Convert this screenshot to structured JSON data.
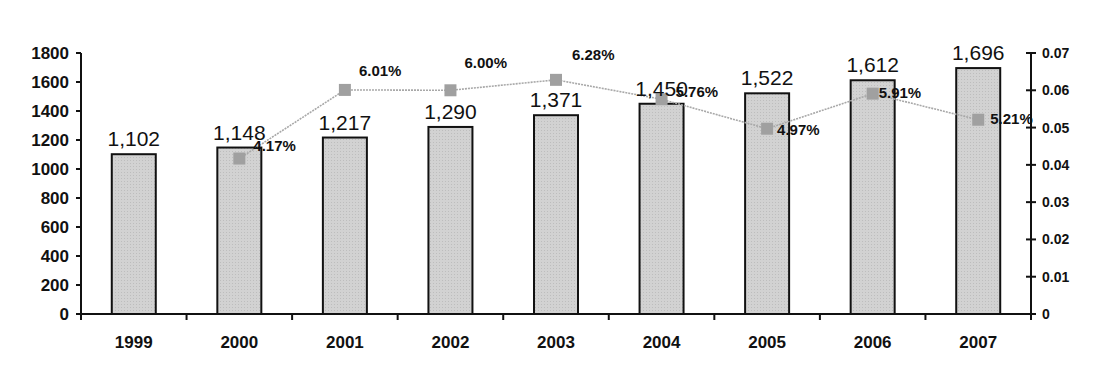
{
  "chart_data": {
    "type": "bar+line",
    "title": "",
    "xlabel": "",
    "ylabel": "",
    "y2label": "",
    "categories": [
      "1999",
      "2000",
      "2001",
      "2002",
      "2003",
      "2004",
      "2005",
      "2006",
      "2007"
    ],
    "series": [
      {
        "name": "Value",
        "type": "bar",
        "axis": "left",
        "values": [
          1102,
          1148,
          1217,
          1290,
          1371,
          1450,
          1522,
          1612,
          1696
        ],
        "labels": [
          "1,102",
          "1,148",
          "1,217",
          "1,290",
          "1,371",
          "1,450",
          "1,522",
          "1,612",
          "1,696"
        ]
      },
      {
        "name": "Growth rate",
        "type": "line",
        "axis": "right",
        "values": [
          null,
          0.0417,
          0.0601,
          0.06,
          0.0628,
          0.0576,
          0.0497,
          0.0591,
          0.0521
        ],
        "labels": [
          "",
          "4.17%",
          "6.01%",
          "6.00%",
          "6.28%",
          "5.76%",
          "4.97%",
          "5.91%",
          "5.21%"
        ]
      }
    ],
    "ylim": [
      0,
      1800
    ],
    "yticks": [
      "0",
      "200",
      "400",
      "600",
      "800",
      "1000",
      "1200",
      "1400",
      "1600",
      "1800"
    ],
    "y2lim": [
      0,
      0.07
    ],
    "y2ticks": [
      "0",
      "0.01",
      "0.02",
      "0.03",
      "0.04",
      "0.05",
      "0.06",
      "0.07"
    ],
    "grid": false,
    "legend": "none",
    "colors": {
      "bar_fill": "#d2d2d2",
      "bar_stroke": "#111111",
      "line": "#a8a8a8",
      "marker": "#a0a0a0",
      "axis": "#111111"
    }
  }
}
